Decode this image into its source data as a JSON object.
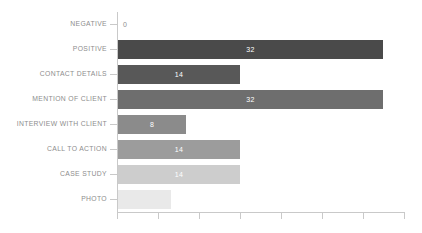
{
  "chart_data": {
    "type": "bar",
    "orientation": "horizontal",
    "title": "",
    "subtitle": "",
    "xlabel": "",
    "ylabel": "",
    "grid": false,
    "legend": false,
    "xlim": [
      0,
      36
    ],
    "categories": [
      "NEGATIVE",
      "POSITIVE",
      "CONTACT DETAILS",
      "MENTION OF CLIENT",
      "INTERVIEW WITH CLIENT",
      "CALL TO ACTION",
      "CASE STUDY",
      "PHOTO"
    ],
    "values": [
      0,
      32,
      14,
      32,
      8,
      14,
      14,
      7
    ],
    "value_labels": [
      "0",
      "32",
      "14",
      "32",
      "8",
      "14",
      "14",
      ""
    ],
    "bar_colors": [
      "#ffffff",
      "#4a4a4a",
      "#585858",
      "#6e6e6e",
      "#8b8b8b",
      "#9c9c9c",
      "#cdcdcd",
      "#e9e9e9"
    ],
    "bars": [
      {
        "label": "NEGATIVE",
        "value": 0,
        "value_label": "0",
        "color": "#ffffff",
        "width_px": 0,
        "label_inside": false
      },
      {
        "label": "POSITIVE",
        "value": 32,
        "value_label": "32",
        "color": "#4a4a4a",
        "width_px": 265,
        "label_inside": true
      },
      {
        "label": "CONTACT DETAILS",
        "value": 14,
        "value_label": "14",
        "color": "#585858",
        "width_px": 122,
        "label_inside": true
      },
      {
        "label": "MENTION OF CLIENT",
        "value": 32,
        "value_label": "32",
        "color": "#6e6e6e",
        "width_px": 265,
        "label_inside": true
      },
      {
        "label": "INTERVIEW WITH CLIENT",
        "value": 8,
        "value_label": "8",
        "color": "#8b8b8b",
        "width_px": 68,
        "label_inside": true
      },
      {
        "label": "CALL TO ACTION",
        "value": 14,
        "value_label": "14",
        "color": "#9c9c9c",
        "width_px": 122,
        "label_inside": true
      },
      {
        "label": "CASE STUDY",
        "value": 14,
        "value_label": "14",
        "color": "#cdcdcd",
        "width_px": 122,
        "label_inside": true
      },
      {
        "label": "PHOTO",
        "value": 7,
        "value_label": "",
        "color": "#e9e9e9",
        "width_px": 53,
        "label_inside": false
      }
    ],
    "x_tick_positions_px": [
      0,
      41,
      82,
      123,
      164,
      205,
      246,
      287
    ],
    "x_tick_labels": [
      "",
      "",
      "",
      "",
      "",
      "",
      "",
      ""
    ],
    "axis_color": "#c9c9c9",
    "label_color": "#8d8d8d",
    "value_text_color": "#ffffff",
    "background_color": "#ffffff"
  }
}
